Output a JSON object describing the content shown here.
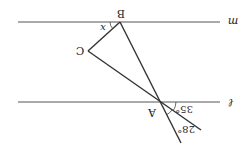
{
  "diagram": {
    "orientation": "rotated 180 degrees",
    "lines": {
      "m": {
        "label": "m",
        "x1": 18,
        "y1": 22,
        "x2": 220,
        "y2": 22,
        "label_x": 233,
        "label_y": 22
      },
      "l": {
        "label": "ℓ",
        "x1": 18,
        "y1": 102,
        "x2": 220,
        "y2": 102,
        "label_x": 231,
        "label_y": 103
      }
    },
    "points": {
      "A": {
        "label": "A",
        "x": 160,
        "y": 102,
        "label_x": 152,
        "label_y": 113
      },
      "B": {
        "label": "B",
        "x": 120,
        "y": 22,
        "label_x": 121,
        "label_y": 14
      },
      "C": {
        "label": "C",
        "x": 88,
        "y": 51,
        "label_x": 80,
        "label_y": 51
      }
    },
    "segments": [
      {
        "name": "BA-extended",
        "x1": 120,
        "y1": 22,
        "x2": 181,
        "y2": 143
      },
      {
        "name": "CA-extended",
        "x1": 88,
        "y1": 51,
        "x2": 201,
        "y2": 130
      },
      {
        "name": "BC",
        "x1": 120,
        "y1": 22,
        "x2": 88,
        "y2": 51
      }
    ],
    "angles": {
      "x": {
        "label": "x",
        "label_x": 103,
        "label_y": 28
      },
      "a35": {
        "label": "35°",
        "label_x": 184,
        "label_y": 110
      },
      "a28": {
        "label": "28°",
        "label_x": 186,
        "label_y": 130
      }
    },
    "stroke_color": "#333333"
  }
}
